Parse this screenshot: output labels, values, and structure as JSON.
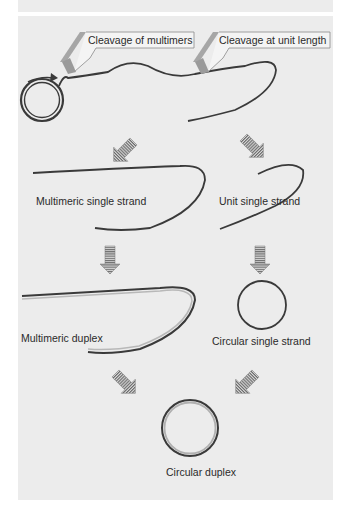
{
  "figure": {
    "callouts": [
      {
        "label": "Cleavage of multimers"
      },
      {
        "label": "Cleavage at unit length"
      }
    ],
    "nodes": {
      "multimeric_single_strand": "Multimeric single strand",
      "unit_single_strand": "Unit single strand",
      "multimeric_duplex": "Multimeric duplex",
      "circular_single_strand": "Circular single strand",
      "circular_duplex": "Circular duplex"
    },
    "colors": {
      "panel_bg": "#ececec",
      "strand_dark": "#3a3a3a",
      "strand_light": "#b8b8b8",
      "arrow_fill": "#9a9a9a",
      "callout_stripe": "#a6a6a6"
    }
  }
}
